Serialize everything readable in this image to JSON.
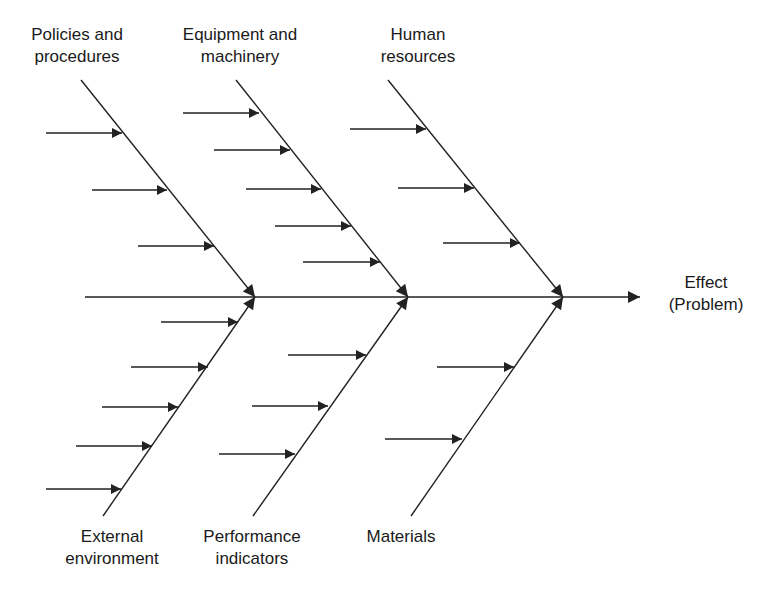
{
  "diagram": {
    "type": "fishbone (Ishikawa) cause-and-effect diagram",
    "stroke_color": "#222222",
    "background_color": "#ffffff",
    "effect": {
      "lines": [
        "Effect",
        "(Problem)"
      ],
      "x": 706,
      "y": 272
    },
    "spine": {
      "x1": 85,
      "y1": 297,
      "x2": 640,
      "y2": 297
    },
    "categories": [
      {
        "id": "policies-and-procedures",
        "position": "top",
        "lines": [
          "Policies and",
          "procedures"
        ],
        "label_x": 77,
        "label_y": 24,
        "bone": {
          "x1": 81,
          "y1": 80,
          "x2": 255,
          "y2": 297
        },
        "causes": [
          {
            "x1": 46,
            "x2": 122,
            "y": 133
          },
          {
            "x1": 92,
            "x2": 167,
            "y": 190
          },
          {
            "x1": 138,
            "x2": 214,
            "y": 246
          }
        ]
      },
      {
        "id": "equipment-and-machinery",
        "position": "top",
        "lines": [
          "Equipment and",
          "machinery"
        ],
        "label_x": 240,
        "label_y": 24,
        "bone": {
          "x1": 236,
          "y1": 80,
          "x2": 408,
          "y2": 297
        },
        "causes": [
          {
            "x1": 183,
            "x2": 259,
            "y": 113
          },
          {
            "x1": 214,
            "x2": 290,
            "y": 150
          },
          {
            "x1": 246,
            "x2": 321,
            "y": 189
          },
          {
            "x1": 275,
            "x2": 351,
            "y": 226
          },
          {
            "x1": 303,
            "x2": 380,
            "y": 262
          }
        ]
      },
      {
        "id": "human-resources",
        "position": "top",
        "lines": [
          "Human",
          "resources"
        ],
        "label_x": 418,
        "label_y": 24,
        "bone": {
          "x1": 388,
          "y1": 80,
          "x2": 563,
          "y2": 297
        },
        "causes": [
          {
            "x1": 350,
            "x2": 426,
            "y": 129
          },
          {
            "x1": 398,
            "x2": 474,
            "y": 188
          },
          {
            "x1": 443,
            "x2": 520,
            "y": 243
          }
        ]
      },
      {
        "id": "external-environment",
        "position": "bottom",
        "lines": [
          "External",
          "environment"
        ],
        "label_x": 112,
        "label_y": 526,
        "bone": {
          "x1": 103,
          "y1": 516,
          "x2": 255,
          "y2": 297
        },
        "causes": [
          {
            "x1": 161,
            "x2": 238,
            "y": 322
          },
          {
            "x1": 131,
            "x2": 208,
            "y": 367
          },
          {
            "x1": 102,
            "x2": 178,
            "y": 407
          },
          {
            "x1": 76,
            "x2": 152,
            "y": 446
          },
          {
            "x1": 46,
            "x2": 121,
            "y": 489
          }
        ]
      },
      {
        "id": "performance-indicators",
        "position": "bottom",
        "lines": [
          "Performance",
          "indicators"
        ],
        "label_x": 252,
        "label_y": 526,
        "bone": {
          "x1": 253,
          "y1": 516,
          "x2": 408,
          "y2": 297
        },
        "causes": [
          {
            "x1": 288,
            "x2": 366,
            "y": 355
          },
          {
            "x1": 252,
            "x2": 328,
            "y": 406
          },
          {
            "x1": 219,
            "x2": 295,
            "y": 454
          }
        ]
      },
      {
        "id": "materials",
        "position": "bottom",
        "lines": [
          "Materials"
        ],
        "label_x": 401,
        "label_y": 526,
        "bone": {
          "x1": 411,
          "y1": 516,
          "x2": 563,
          "y2": 297
        },
        "causes": [
          {
            "x1": 437,
            "x2": 514,
            "y": 367
          },
          {
            "x1": 385,
            "x2": 462,
            "y": 439
          }
        ]
      }
    ]
  }
}
